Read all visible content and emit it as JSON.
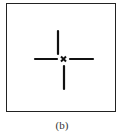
{
  "figure": {
    "caption": "(b)",
    "center_marker": "x",
    "line_color": "#111111",
    "frame_color": "#222222"
  }
}
